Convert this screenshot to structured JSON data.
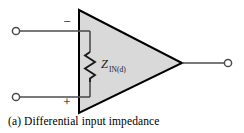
{
  "figure": {
    "caption": "(a) Differential input impedance",
    "colors": {
      "background": "#ffffff",
      "amp_fill": "#d9d9d9",
      "amp_stroke": "#000000",
      "wire": "#4d4d4d",
      "terminal_stroke": "#4d4d4d",
      "terminal_fill": "#ffffff",
      "label_text": "#1a1a1a",
      "caption_text": "#000000"
    },
    "amplifier": {
      "name": "operational-amplifier",
      "shape": "triangle",
      "inverting_input_sign": "−",
      "noninverting_input_sign": "+"
    },
    "impedance": {
      "symbol": "Z",
      "subscript": "IN(d)",
      "element": "resistor-zigzag"
    },
    "terminals": {
      "inverting_input": "input-terminal-inverting",
      "noninverting_input": "input-terminal-noninverting",
      "output": "output-terminal"
    }
  }
}
